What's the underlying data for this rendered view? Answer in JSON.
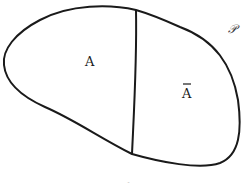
{
  "diagram": {
    "universe_label": "𝒫",
    "region_a_label": "A",
    "region_complement_label": "A",
    "complement_bar": true,
    "caption": "Fig. 1"
  }
}
